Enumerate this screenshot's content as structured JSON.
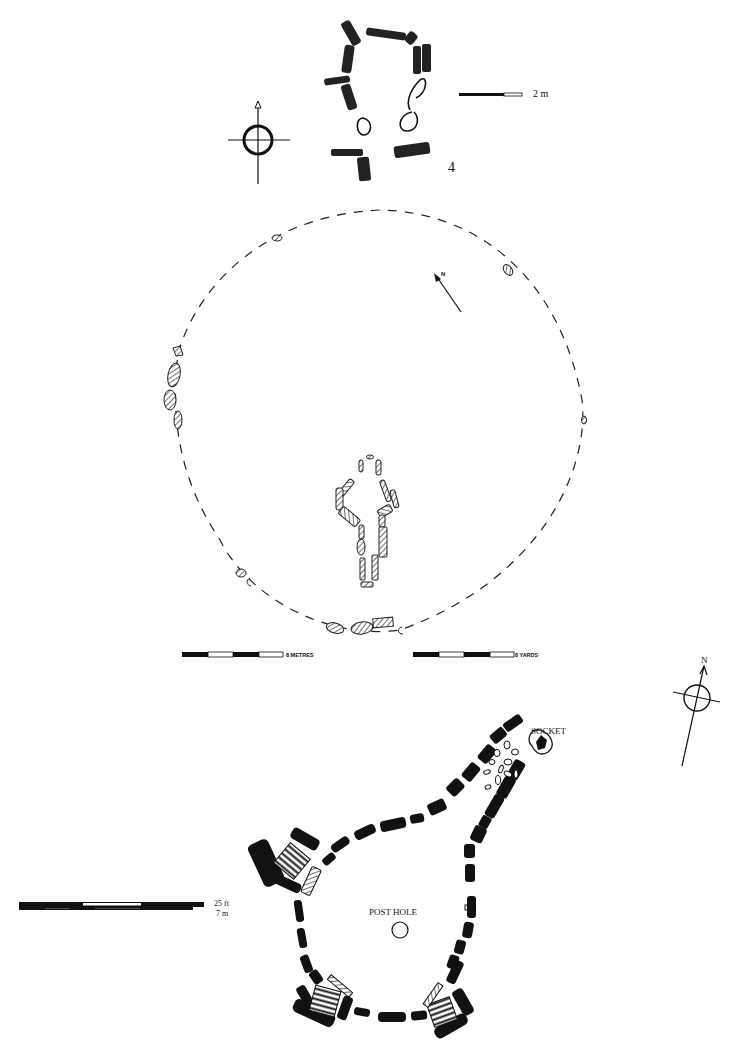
{
  "plans": {
    "plan_4": {
      "figure_number": "4",
      "scale_label": "2 m",
      "north_marker": "north-arrow-with-circle"
    },
    "circle_plan": {
      "north_label": "N",
      "scale_metres_label": "8 METRES",
      "scale_yards_label": "8 YARDS"
    },
    "court_tomb_plan": {
      "socket_label": "SOCKET",
      "post_hole_label": "POST HOLE",
      "north_label": "N",
      "scale_ft_label": "25 ft",
      "scale_m_label": "7 m"
    }
  },
  "colors": {
    "ink": "#111111",
    "paper": "#ffffff",
    "hatch": "#333333"
  }
}
